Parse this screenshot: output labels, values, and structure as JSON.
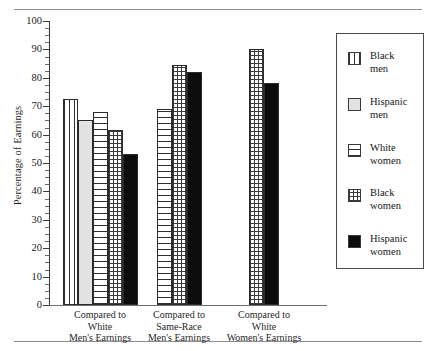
{
  "figure": {
    "has_top_rule": true,
    "has_bottom_rule": true
  },
  "chart_data": {
    "type": "bar",
    "title": "",
    "subtitle": "",
    "xlabel": "",
    "ylabel": "Percentage of Earnings",
    "ylim": [
      0,
      100
    ],
    "ytick_step": 10,
    "yticks": [
      0,
      10,
      20,
      30,
      40,
      50,
      60,
      70,
      80,
      90,
      100
    ],
    "ytick_labels": [
      "0",
      "10",
      "20",
      "30",
      "40",
      "50",
      "60",
      "70",
      "80",
      "90",
      "100"
    ],
    "minor_ticks": true,
    "grid": false,
    "legend_position": "right",
    "categories": [
      "Compared to White Men's Earnings",
      "Compared to Same-Race Men's Earnings",
      "Compared to White Women's Earnings"
    ],
    "category_lines": [
      [
        "Compared to",
        "White",
        "Men's Earnings"
      ],
      [
        "Compared to",
        "Same-Race",
        "Men's Earnings"
      ],
      [
        "Compared to",
        "White",
        "Women's Earnings"
      ]
    ],
    "series": [
      {
        "name": "Black men",
        "pattern": "vertical-stripes",
        "values": [
          72.5,
          null,
          null
        ]
      },
      {
        "name": "Hispanic men",
        "pattern": "light-gray-solid",
        "values": [
          65,
          null,
          null
        ]
      },
      {
        "name": "White women",
        "pattern": "horizontal-stripes",
        "values": [
          68,
          69,
          null
        ]
      },
      {
        "name": "Black women",
        "pattern": "checkered",
        "values": [
          61.5,
          84.5,
          90
        ]
      },
      {
        "name": "Hispanic women",
        "pattern": "solid-black",
        "values": [
          53,
          82,
          78
        ]
      }
    ],
    "groups": [
      {
        "label": "Compared to White Men's Earnings",
        "bars": [
          {
            "series": "Black men",
            "value": 72.5,
            "pattern": "vertical-stripes"
          },
          {
            "series": "Hispanic men",
            "value": 65,
            "pattern": "light-gray-solid"
          },
          {
            "series": "White women",
            "value": 68,
            "pattern": "horizontal-stripes"
          },
          {
            "series": "Black women",
            "value": 61.5,
            "pattern": "checkered"
          },
          {
            "series": "Hispanic women",
            "value": 53,
            "pattern": "solid-black"
          }
        ]
      },
      {
        "label": "Compared to Same-Race Men's Earnings",
        "bars": [
          {
            "series": "White women",
            "value": 69,
            "pattern": "horizontal-stripes"
          },
          {
            "series": "Black women",
            "value": 84.5,
            "pattern": "checkered"
          },
          {
            "series": "Hispanic women",
            "value": 82,
            "pattern": "solid-black"
          }
        ]
      },
      {
        "label": "Compared to White Women's Earnings",
        "bars": [
          {
            "series": "Black women",
            "value": 90,
            "pattern": "checkered"
          },
          {
            "series": "Hispanic women",
            "value": 78,
            "pattern": "solid-black"
          }
        ]
      }
    ],
    "legend": [
      {
        "label_lines": [
          "Black",
          "men"
        ],
        "label": "Black men",
        "pattern": "vertical-stripes"
      },
      {
        "label_lines": [
          "Hispanic",
          "men"
        ],
        "label": "Hispanic men",
        "pattern": "light-gray-solid"
      },
      {
        "label_lines": [
          "White",
          "women"
        ],
        "label": "White women",
        "pattern": "horizontal-stripes"
      },
      {
        "label_lines": [
          "Black",
          "women"
        ],
        "label": "Black women",
        "pattern": "checkered"
      },
      {
        "label_lines": [
          "Hispanic",
          "women"
        ],
        "label": "Hispanic women",
        "pattern": "solid-black"
      }
    ],
    "colors": {
      "ink": "#1a1a1a",
      "axis": "#3a3a3a",
      "bar_outline": "#2b2b2b",
      "light_gray_fill": "#e2e2e2",
      "black_fill": "#0c0c0c",
      "background": "#ffffff"
    }
  }
}
